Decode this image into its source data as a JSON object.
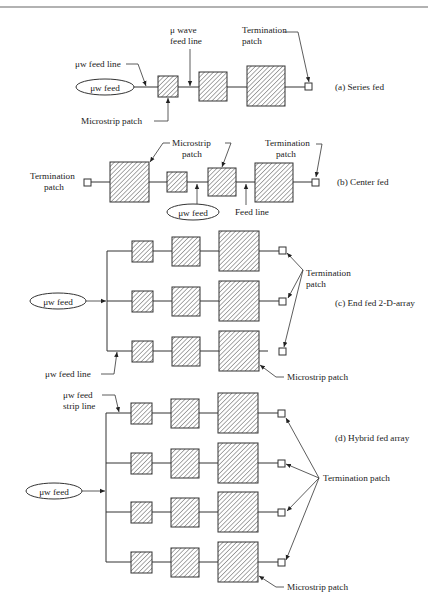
{
  "figure": {
    "sections": [
      {
        "id": "a",
        "caption": "(a) Series fed",
        "labels": {
          "feed": "μw feed",
          "feed_line": "μw feed line",
          "wave_feed_line_1": "μ wave",
          "wave_feed_line_2": "feed line",
          "termination_1": "Termination",
          "termination_2": "patch",
          "microstrip": "Microstrip patch"
        }
      },
      {
        "id": "b",
        "caption": "(b) Center fed",
        "labels": {
          "termination_left_1": "Termination",
          "termination_left_2": "patch",
          "microstrip_1": "Microstrip",
          "microstrip_2": "patch",
          "termination_right_1": "Termination",
          "termination_right_2": "patch",
          "feed": "μw feed",
          "feed_line": "Feed line"
        }
      },
      {
        "id": "c",
        "caption": "(c) End fed 2-D-array",
        "labels": {
          "feed": "μw feed",
          "termination_1": "Termination",
          "termination_2": "patch",
          "feed_line": "μw feed line",
          "microstrip": "Microstrip patch"
        }
      },
      {
        "id": "d",
        "caption": "(d) Hybrid fed array",
        "labels": {
          "strip_line_1": "μw feed",
          "strip_line_2": "strip line",
          "feed": "μw feed",
          "termination": "Termination patch",
          "microstrip": "Microstrip patch"
        }
      }
    ]
  }
}
